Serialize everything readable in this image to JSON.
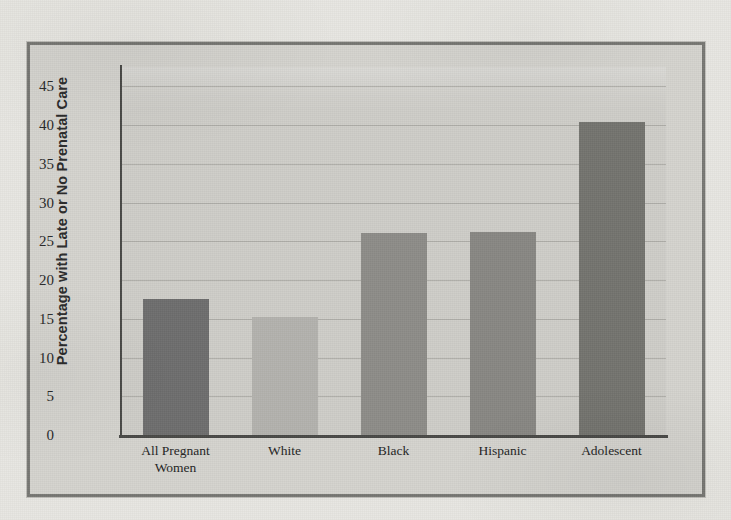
{
  "figure": {
    "frame_border_color": "#787874",
    "figure_background": "#d5d4cf",
    "plot_background": "#cfcec9",
    "gridline_color": "#a9a8a3",
    "axis_color": "#4a4a47",
    "page_background": "#e8e7e2"
  },
  "chart_data": {
    "type": "bar",
    "title": "",
    "xlabel": "",
    "ylabel": "Percentage with Late or No Prenatal Care",
    "categories": [
      "All Pregnant Women",
      "White",
      "Black",
      "Hispanic",
      "Adolescent"
    ],
    "category_lines": [
      [
        "All Pregnant",
        "Women"
      ],
      [
        "White"
      ],
      [
        "Black"
      ],
      [
        "Hispanic"
      ],
      [
        "Adolescent"
      ]
    ],
    "values": [
      17.5,
      15.2,
      26.1,
      26.2,
      40.4
    ],
    "bar_colors": [
      "#6e6e6e",
      "#b4b3ae",
      "#8e8d89",
      "#898884",
      "#74746f"
    ],
    "ylim": [
      0,
      47.5
    ],
    "yticks": [
      0,
      5,
      10,
      15,
      20,
      25,
      30,
      35,
      40,
      45
    ],
    "ytick_labels": [
      "0",
      "5",
      "10",
      "15",
      "20",
      "25",
      "30",
      "35",
      "40",
      "45"
    ],
    "grid": true,
    "grid_axis": "y",
    "legend": null,
    "legend_position": "none"
  }
}
